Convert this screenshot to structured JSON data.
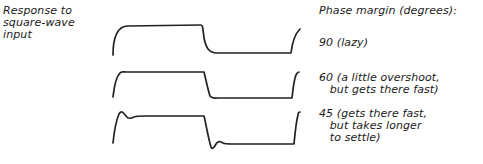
{
  "diagram": {
    "left_title": "Response to\nsquare-wave\ninput",
    "legend_title": "Phase margin (degrees):",
    "cases": [
      {
        "label": "90 (lazy)",
        "phase_margin_deg": 90,
        "description": "lazy"
      },
      {
        "label": "60 (a little overshoot,\n   but gets there fast)",
        "phase_margin_deg": 60,
        "description": "a little overshoot, but gets there fast"
      },
      {
        "label": "45 (gets there fast,\n   but takes longer\n   to settle)",
        "phase_margin_deg": 45,
        "description": "gets there fast, but takes longer to settle"
      }
    ],
    "stroke_color": "#222222",
    "text_color": "#1a1a1a"
  }
}
